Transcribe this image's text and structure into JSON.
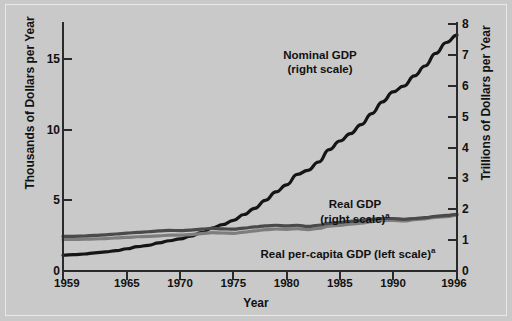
{
  "figure": {
    "background_color": "#c9c9c9",
    "frame_color": "#e8e8e8"
  },
  "chart_data": {
    "type": "line",
    "title": "",
    "xlabel": "Year",
    "ylabel": "Thousands of Dollars per Year",
    "ylabel_right": "Trillions of Dollars per Year",
    "grid": false,
    "legend_position": "inline-annotations",
    "xlim": [
      1959,
      1996
    ],
    "ylim_left": [
      0,
      17.5
    ],
    "ylim_right": [
      0,
      8
    ],
    "xticks": [
      1959,
      1965,
      1970,
      1975,
      1980,
      1985,
      1990,
      1996
    ],
    "xtick_labels": [
      "1959",
      "1965",
      "1970",
      "1975",
      "1980",
      "1985",
      "1990",
      "1996"
    ],
    "yticks_left": [
      0,
      5,
      10,
      15
    ],
    "ytick_labels_left": [
      "0",
      "5",
      "10",
      "15"
    ],
    "yticks_right": [
      0,
      1,
      2,
      3,
      4,
      5,
      6,
      7,
      8
    ],
    "ytick_labels_right": [
      "0",
      "1",
      "2",
      "3",
      "4",
      "5",
      "6",
      "7",
      "8"
    ],
    "x": [
      1959,
      1960,
      1961,
      1962,
      1963,
      1964,
      1965,
      1966,
      1967,
      1968,
      1969,
      1970,
      1971,
      1972,
      1973,
      1974,
      1975,
      1976,
      1977,
      1978,
      1979,
      1980,
      1981,
      1982,
      1983,
      1984,
      1985,
      1986,
      1987,
      1988,
      1989,
      1990,
      1991,
      1992,
      1993,
      1994,
      1995,
      1996
    ],
    "series": [
      {
        "name": "Nominal GDP",
        "scale": "right",
        "unit": "Trillions of Dollars per Year",
        "color": "#151515",
        "line_width": 3.2,
        "values": [
          0.51,
          0.53,
          0.55,
          0.59,
          0.62,
          0.66,
          0.72,
          0.79,
          0.83,
          0.91,
          0.98,
          1.04,
          1.13,
          1.24,
          1.39,
          1.5,
          1.64,
          1.83,
          2.03,
          2.29,
          2.56,
          2.79,
          3.13,
          3.26,
          3.53,
          3.93,
          4.21,
          4.45,
          4.74,
          5.1,
          5.48,
          5.8,
          5.99,
          6.32,
          6.64,
          7.05,
          7.4,
          7.64
        ]
      },
      {
        "name": "Real GDP",
        "scale": "right",
        "unit": "Trillions of Dollars per Year",
        "color": "#7d7d7d",
        "line_width": 3.2,
        "values": [
          2.32,
          2.38,
          2.44,
          2.58,
          2.69,
          2.85,
          3.03,
          3.23,
          3.31,
          3.47,
          3.57,
          3.58,
          3.7,
          3.9,
          4.12,
          4.1,
          4.08,
          4.31,
          4.51,
          4.76,
          4.91,
          4.9,
          5.02,
          4.92,
          5.14,
          5.51,
          5.72,
          5.92,
          6.12,
          6.38,
          6.61,
          6.71,
          6.68,
          6.88,
          7.06,
          7.35,
          7.54,
          7.81
        ],
        "display_values": [
          1.02,
          1.02,
          1.03,
          1.04,
          1.05,
          1.07,
          1.09,
          1.11,
          1.12,
          1.14,
          1.16,
          1.16,
          1.18,
          1.21,
          1.24,
          1.23,
          1.22,
          1.26,
          1.3,
          1.34,
          1.36,
          1.35,
          1.37,
          1.34,
          1.38,
          1.45,
          1.48,
          1.52,
          1.55,
          1.6,
          1.63,
          1.64,
          1.62,
          1.66,
          1.69,
          1.74,
          1.76,
          1.81
        ]
      },
      {
        "name": "Real per-capita GDP",
        "scale": "left",
        "unit": "Thousands of Dollars per Year",
        "color": "#4a4a4a",
        "line_width": 3.2,
        "values": [
          13.1,
          13.2,
          13.3,
          13.9,
          14.2,
          14.9,
          15.6,
          16.5,
          16.7,
          17.3,
          17.6,
          17.4,
          17.8,
          18.6,
          19.5,
          19.2,
          18.9,
          19.8,
          20.5,
          21.4,
          21.8,
          21.5,
          21.9,
          21.2,
          21.9,
          23.3,
          23.9,
          24.5,
          25.1,
          25.9,
          26.6,
          26.7,
          26.3,
          26.8,
          27.2,
          28.0,
          28.5,
          29.2
        ],
        "display_values": [
          2.45,
          2.46,
          2.48,
          2.52,
          2.56,
          2.62,
          2.68,
          2.74,
          2.78,
          2.84,
          2.88,
          2.86,
          2.9,
          2.96,
          3.02,
          2.99,
          2.96,
          3.04,
          3.12,
          3.2,
          3.24,
          3.2,
          3.24,
          3.16,
          3.24,
          3.38,
          3.44,
          3.52,
          3.58,
          3.66,
          3.72,
          3.72,
          3.66,
          3.72,
          3.78,
          3.88,
          3.94,
          4.02
        ]
      }
    ],
    "annotations": [
      {
        "id": "nominal",
        "line1": "Nominal GDP",
        "line2": "(right scale)",
        "sup": ""
      },
      {
        "id": "real",
        "line1": "Real GDP",
        "line2": "(right scale)",
        "sup": "a"
      },
      {
        "id": "percap",
        "line1": "Real per-capita GDP (left scale)",
        "line2": "",
        "sup": "a"
      }
    ]
  }
}
